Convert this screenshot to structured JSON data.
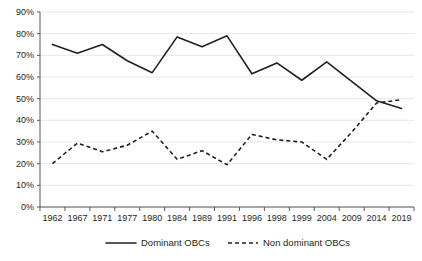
{
  "chart_data": {
    "type": "line",
    "title": "",
    "subtitle": "",
    "xlabel": "",
    "ylabel": "",
    "categories": [
      "1962",
      "1967",
      "1971",
      "1977",
      "1980",
      "1984",
      "1989",
      "1991",
      "1996",
      "1998",
      "1999",
      "2004",
      "2009",
      "2014",
      "2019"
    ],
    "ylim": [
      0,
      90
    ],
    "ytick_labels": [
      "0%",
      "10%",
      "20%",
      "30%",
      "40%",
      "50%",
      "60%",
      "70%",
      "80%",
      "90%"
    ],
    "ytick_values": [
      0,
      10,
      20,
      30,
      40,
      50,
      60,
      70,
      80,
      90
    ],
    "grid": true,
    "legend_position": "bottom",
    "series": [
      {
        "name": "Dominant OBCs",
        "style": "solid",
        "color": "#231f20",
        "values": [
          75,
          71,
          75,
          67.5,
          62,
          78.5,
          74,
          79,
          61.5,
          66.5,
          58.5,
          67,
          58,
          49,
          45.5
        ]
      },
      {
        "name": "Non dominant OBCs",
        "style": "dashed",
        "color": "#231f20",
        "values": [
          20,
          29.5,
          25.5,
          28.5,
          35,
          22,
          26,
          19.5,
          33.5,
          31,
          30,
          22,
          34.5,
          48,
          49.5
        ]
      }
    ]
  },
  "legend": {
    "items": [
      {
        "label": "Dominant OBCs",
        "style": "solid"
      },
      {
        "label": "Non dominant OBCs",
        "style": "dashed"
      }
    ]
  },
  "colors": {
    "gridline": "#e6e7e8",
    "axis": "#58595b",
    "ink": "#231f20",
    "background": "#ffffff"
  }
}
